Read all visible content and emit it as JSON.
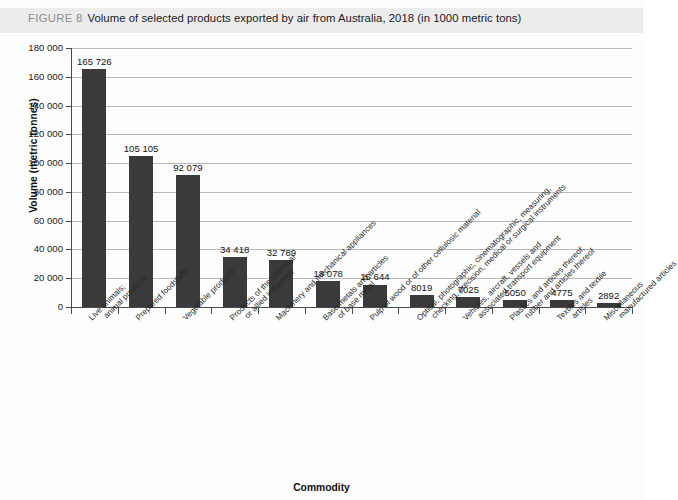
{
  "caption": {
    "figure_label": "FIGURE 8",
    "title": "Volume of selected products exported by air from Australia, 2018 (in 1000 metric tons)"
  },
  "chart_data": {
    "type": "bar",
    "title": "Volume of selected products exported by air from Australia, 2018 (in 1000 metric tons)",
    "xlabel": "Commodity",
    "ylabel": "Volume (metric tonnes)",
    "ylim": [
      0,
      180000
    ],
    "ytick_values": [
      0,
      20000,
      40000,
      60000,
      80000,
      100000,
      120000,
      140000,
      160000,
      180000
    ],
    "ytick_labels": [
      "0",
      "20 000",
      "40 000",
      "60 000",
      "80 000",
      "100 000",
      "120 000",
      "140 000",
      "160 000",
      "180 000"
    ],
    "grid": true,
    "legend": "none",
    "bar_color": "#3a3a3a",
    "categories": [
      "Live animals; animal products",
      "Prepared foodstuffs",
      "Vegetable products",
      "Products of the chemical or allied industries",
      "Machinery and mechanical appliances",
      "Base metals and articles of base metal",
      "Pulp of wood or of other cellulosic material",
      "Optical, photographic, cinematographic, measuring, checking, precision, medical or surgical instruments",
      "Vehicles, aircraft, vessels and associated transport equipment",
      "Plastics and articles thereof; rubber and articles thereof",
      "Textiles and textile articles",
      "Miscellaneous manufactured articles"
    ],
    "category_lines": [
      [
        "Live animals;",
        "animal products"
      ],
      [
        "Prepared foodstuffs"
      ],
      [
        "Vegetable products"
      ],
      [
        "Products of the chemical",
        "or allied industries"
      ],
      [
        "Machinery and mechanical appliances"
      ],
      [
        "Base metals and articles",
        "of base metal"
      ],
      [
        "Pulp of wood or of other cellulosic material"
      ],
      [
        "Optical, photographic, cinematographic, measuring,",
        "checking, precision, medical or surgical instruments"
      ],
      [
        "Vehicles, aircraft, vessels and",
        "associated transport equipment"
      ],
      [
        "Plastics and articles thereof;",
        "rubber and articles thereof"
      ],
      [
        "Textiles and textile",
        "articles"
      ],
      [
        "Miscellaneous",
        "manufactured articles"
      ]
    ],
    "values": [
      165726,
      105105,
      92079,
      34418,
      32789,
      18078,
      15644,
      8019,
      7025,
      5050,
      4775,
      2892
    ],
    "value_labels": [
      "165 726",
      "105 105",
      "92 079",
      "34 418",
      "32 789",
      "18 078",
      "15 644",
      "8019",
      "7025",
      "5050",
      "4775",
      "2892"
    ]
  }
}
